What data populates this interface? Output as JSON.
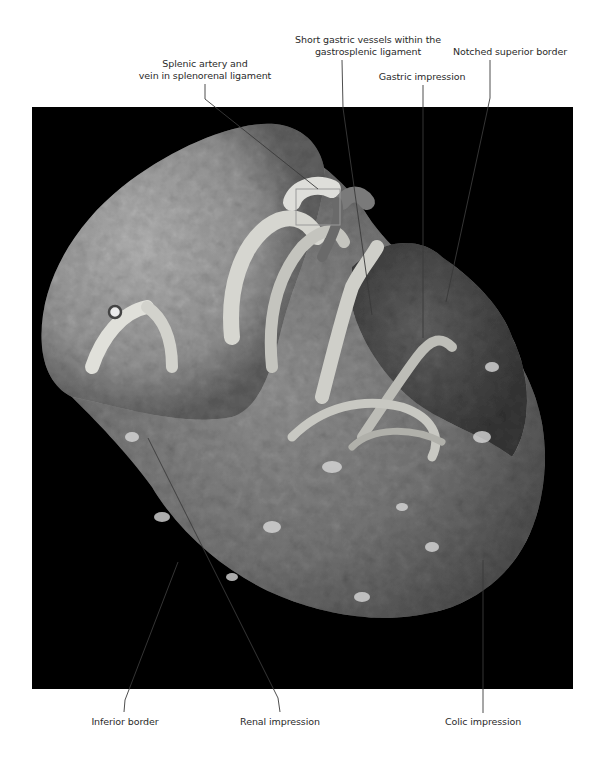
{
  "figure": {
    "colors": {
      "background": "#ffffff",
      "photo_background": "#000000",
      "leader_line": "#3a3a3a",
      "label_text": "#2a2a2a"
    }
  },
  "labels": {
    "short_gastric_line1": "Short gastric vessels within the",
    "short_gastric_line2": "gastrosplenic ligament",
    "notched_superior": "Notched superior border",
    "splenic_artery_line1": "Splenic artery and",
    "splenic_artery_line2": "vein in splenorenal ligament",
    "gastric_impression": "Gastric impression",
    "inferior_border": "Inferior border",
    "renal_impression": "Renal impression",
    "colic_impression": "Colic impression"
  }
}
